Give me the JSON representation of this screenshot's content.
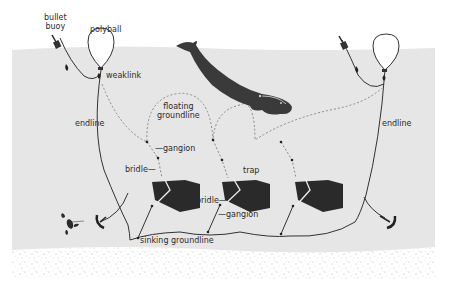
{
  "diagram": {
    "labels": {
      "bullet_buoy_line1": "bullet",
      "bullet_buoy_line2": "buoy",
      "polyball": "polyball",
      "weaklink": "weaklink",
      "endline_left": "endline",
      "endline_right": "endline",
      "floating_groundline_line1": "floating",
      "floating_groundline_line2": "groundline",
      "gangion_upper": "gangion",
      "bridle_upper": "bridle",
      "trap": "trap",
      "bridle_lower": "bridle",
      "gangion_lower": "gangion",
      "sinking_groundline": "sinking groundline"
    },
    "colors": {
      "water": "#e6e6e6",
      "sand": "#ffffff",
      "sand_dots": "#6a6a6a",
      "line": "#333333",
      "dashed_line": "#8a8a8a",
      "trap": "#2a2a2a",
      "whale": "#3a3a3a",
      "polyball_fill": "#ffffff"
    },
    "components": [
      "bullet buoy",
      "polyball",
      "weaklink",
      "endline",
      "floating groundline",
      "gangion",
      "bridle",
      "trap",
      "sinking groundline",
      "anchor",
      "right whale",
      "lobster"
    ]
  }
}
